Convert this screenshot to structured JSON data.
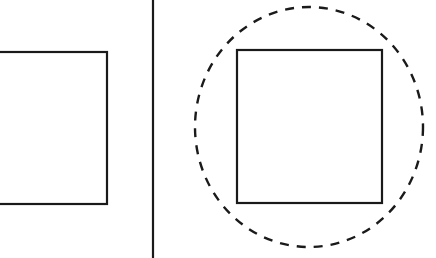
{
  "diagram": {
    "background": "#ffffff",
    "stroke_color": "#1a1a1a",
    "left_panel": {
      "shape": "square",
      "x": -4,
      "y": 52,
      "width": 111,
      "height": 152
    },
    "divider": {
      "x": 153
    },
    "right_panel": {
      "square": {
        "x": 237,
        "y": 50,
        "width": 145,
        "height": 153
      },
      "dashed_circle": {
        "cx": 309,
        "cy": 127,
        "rx": 114,
        "ry": 120
      }
    }
  }
}
